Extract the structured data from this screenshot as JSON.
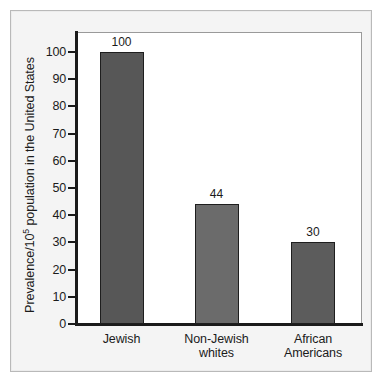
{
  "figure": {
    "background_color": "#ffffff",
    "frame_color": "#b9b9b9",
    "panel_color": "#f4f4f4",
    "axis_color": "#1b1b1b",
    "bar_fill_color": "#575757",
    "bar_edge_color": "#1e1e1e"
  },
  "chart_data": {
    "type": "bar",
    "title": "",
    "xlabel": "",
    "ylabel": "Prevalence/10⁵ population in the United States",
    "ylabel_prefix": "Prevalence/10",
    "ylabel_superscript": "5",
    "ylabel_suffix": " population in the United States",
    "categories": [
      "Jewish",
      "Non-Jewish whites",
      "African Americans"
    ],
    "category_lines": [
      [
        "Jewish"
      ],
      [
        "Non-Jewish",
        "whites"
      ],
      [
        "African",
        "Americans"
      ]
    ],
    "values": [
      100,
      44,
      30
    ],
    "value_labels": [
      "100",
      "44",
      "30"
    ],
    "ylim": [
      0,
      108
    ],
    "yticks": [
      0,
      10,
      20,
      30,
      40,
      50,
      60,
      70,
      80,
      90,
      100
    ],
    "ytick_labels": [
      "0",
      "10",
      "20",
      "30",
      "40",
      "50",
      "60",
      "70",
      "80",
      "90",
      "100"
    ],
    "grid": false,
    "legend": null,
    "legend_position": "none",
    "bar_colors": [
      "#575757",
      "#6b6b6b",
      "#5c5c5c"
    ]
  }
}
